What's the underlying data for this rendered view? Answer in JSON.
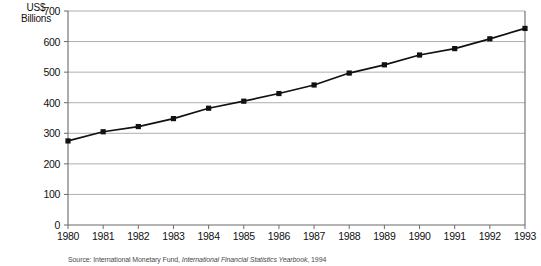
{
  "chart_data": {
    "type": "line",
    "title": "",
    "subtitle": "",
    "xlabel": "",
    "ylabel": "US$\nBillions",
    "ylabel_line1": "US$",
    "ylabel_line2": "Billions",
    "categories": [
      "1980",
      "1981",
      "1982",
      "1983",
      "1984",
      "1985",
      "1986",
      "1987",
      "1988",
      "1989",
      "1990",
      "1991",
      "1992",
      "1993"
    ],
    "values": [
      275,
      305,
      322,
      348,
      382,
      405,
      430,
      458,
      497,
      524,
      556,
      577,
      609,
      643
    ],
    "series": [
      {
        "name": "US$ Billions",
        "values": [
          275,
          305,
          322,
          348,
          382,
          405,
          430,
          458,
          497,
          524,
          556,
          577,
          609,
          643
        ]
      }
    ],
    "ylim": [
      0,
      700
    ],
    "yticks": [
      "0",
      "100",
      "200",
      "300",
      "400",
      "500",
      "600",
      "700"
    ],
    "ytick_values": [
      0,
      100,
      200,
      300,
      400,
      500,
      600,
      700
    ],
    "xticks": [
      "1980",
      "1981",
      "1982",
      "1983",
      "1984",
      "1985",
      "1986",
      "1987",
      "1988",
      "1989",
      "1990",
      "1991",
      "1992",
      "1993"
    ],
    "grid": true,
    "grid_color": "#999999",
    "legend": "none",
    "line_color": "#111111",
    "marker": "square",
    "marker_color": "#111111"
  },
  "source": {
    "prefix": "Source: International Monetary Fund, ",
    "publication": "International Financial Statistics Yearbook",
    "suffix": ", 1994"
  }
}
